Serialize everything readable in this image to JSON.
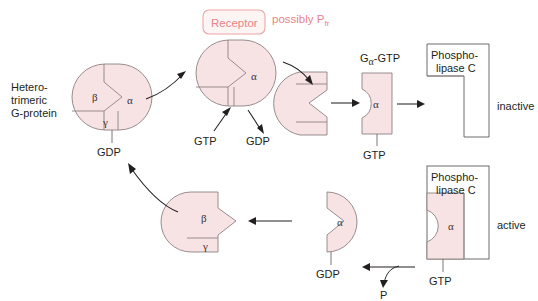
{
  "diagram": {
    "colors": {
      "protein_fill": "#f7e3e4",
      "protein_stroke": "#8d8184",
      "receptor_stroke": "#eda6a8",
      "receptor_text": "#e8848a",
      "label_text": "#231f20",
      "background": "#ffffff"
    }
  },
  "labels": {
    "heterotrimeric_line1": "Hetero-",
    "heterotrimeric_line2": "trimeric",
    "heterotrimeric_line3": "G-protein",
    "receptor": "Receptor",
    "possibly": "possibly P",
    "possibly_subscript": "fr",
    "galpha_g": "G",
    "galpha_sub": "α",
    "galpha_gtp": "-GTP",
    "phospholipase_line1": "Phospho-",
    "phospholipase_line2": "lipase C",
    "inactive": "inactive",
    "active": "active",
    "gtp": "GTP",
    "gdp": "GDP",
    "phosphate": "P",
    "alpha": "α",
    "beta": "β",
    "gamma": "γ"
  },
  "nodes": {
    "heterotrimer": {
      "name": "heterotrimeric-g-protein",
      "subunits": [
        "β",
        "α",
        "γ"
      ],
      "bound_nucleotide": "GDP"
    },
    "receptor_complex": {
      "name": "receptor-bound-g-protein",
      "receptor_label": "Receptor",
      "annotation": "possibly Pfr",
      "subunit_shown": "α",
      "nucleotide_in": "GTP",
      "nucleotide_out": "GDP"
    },
    "dissociating": {
      "name": "dissociating-betagamma-alpha",
      "subunit_shown": "α"
    },
    "alpha_gtp": {
      "name": "alpha-gtp-subunit",
      "label": "Gα-GTP",
      "subunit_shown": "α",
      "bound_nucleotide": "GTP"
    },
    "plc_inactive": {
      "name": "phospholipase-c-inactive",
      "label_line1": "Phospho-",
      "label_line2": "lipase C",
      "state": "inactive"
    },
    "plc_active": {
      "name": "phospholipase-c-active",
      "label_line1": "Phospho-",
      "label_line2": "lipase C",
      "state": "active",
      "bound_subunit": "α",
      "bound_nucleotide": "GTP"
    },
    "alpha_gdp": {
      "name": "alpha-gdp-subunit",
      "subunit_shown": "α",
      "bound_nucleotide": "GDP",
      "released": "P"
    },
    "betagamma": {
      "name": "betagamma-dimer",
      "subunits": [
        "β",
        "γ"
      ]
    }
  },
  "flow": [
    {
      "from": "heterotrimer",
      "to": "receptor_complex"
    },
    {
      "from": "receptor_complex",
      "to": "dissociating"
    },
    {
      "from": "dissociating",
      "to": "alpha_gtp"
    },
    {
      "from": "alpha_gtp",
      "to": "plc_inactive"
    },
    {
      "from": "plc_active",
      "to": "alpha_gdp",
      "releases": "P"
    },
    {
      "from": "alpha_gdp",
      "to": "betagamma"
    },
    {
      "from": "betagamma",
      "to": "heterotrimer"
    }
  ]
}
